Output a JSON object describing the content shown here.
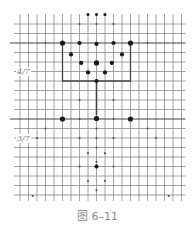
{
  "figure": {
    "caption": "图 6–11",
    "labels": [
      {
        "text": "4/7",
        "x": 16,
        "y": 72
      },
      {
        "text": "3/7",
        "x": 16,
        "y": 139
      }
    ],
    "colors": {
      "grid": "#8c8c8c",
      "grid_bold": "#444444",
      "dot": "#1a1a1a",
      "small_dot": "#555555",
      "caption": "#8a8a8a",
      "background": "#ffffff"
    },
    "grid": {
      "x0": 20,
      "x_step": 8.5,
      "cols": 20,
      "y0": 24,
      "y_step": 9.5,
      "rows": 19,
      "line_top": 14,
      "line_bottom": 201
    },
    "bold_rows": [
      2,
      10
    ],
    "bracket": {
      "left_col": 5,
      "right_col": 13,
      "top_row": 2,
      "bottom_row": 6,
      "stem_col": 9,
      "stem_bottom_row": 9.6
    },
    "dots": [
      {
        "col": 8,
        "row": -1,
        "size": "s"
      },
      {
        "col": 9,
        "row": -1,
        "size": "s"
      },
      {
        "col": 10,
        "row": -1,
        "size": "s"
      },
      {
        "col": 7,
        "row": 0,
        "size": "xs"
      },
      {
        "col": 9,
        "row": 0,
        "size": "xs"
      },
      {
        "col": 11,
        "row": 0,
        "size": "xs"
      },
      {
        "col": 3,
        "row": 2,
        "size": "xs"
      },
      {
        "col": 5,
        "row": 2,
        "size": "l"
      },
      {
        "col": 7,
        "row": 2,
        "size": "m"
      },
      {
        "col": 9,
        "row": 2.1,
        "size": "m"
      },
      {
        "col": 11,
        "row": 2,
        "size": "m"
      },
      {
        "col": 13,
        "row": 2,
        "size": "l"
      },
      {
        "col": 15,
        "row": 2,
        "size": "xs"
      },
      {
        "col": 6,
        "row": 3.2,
        "size": "m"
      },
      {
        "col": 12,
        "row": 3.2,
        "size": "m"
      },
      {
        "col": 7.2,
        "row": 4.1,
        "size": "m"
      },
      {
        "col": 9,
        "row": 4.1,
        "size": "l"
      },
      {
        "col": 10.8,
        "row": 4.1,
        "size": "m"
      },
      {
        "col": 8,
        "row": 5.1,
        "size": "m"
      },
      {
        "col": 10,
        "row": 5.1,
        "size": "m"
      },
      {
        "col": 9,
        "row": 6,
        "size": "m"
      },
      {
        "col": 7,
        "row": 8,
        "size": "xs"
      },
      {
        "col": 11,
        "row": 8,
        "size": "xs"
      },
      {
        "col": 7,
        "row": 10,
        "size": "xs"
      },
      {
        "col": 11,
        "row": 10,
        "size": "xs"
      },
      {
        "col": 5,
        "row": 10,
        "size": "l"
      },
      {
        "col": 9,
        "row": 9.95,
        "size": "l"
      },
      {
        "col": 13,
        "row": 10,
        "size": "l"
      },
      {
        "col": 3,
        "row": 11,
        "size": "xs"
      },
      {
        "col": 9,
        "row": 11,
        "size": "xs"
      },
      {
        "col": 15,
        "row": 11,
        "size": "xs"
      },
      {
        "col": 2,
        "row": 12,
        "size": "xs"
      },
      {
        "col": 7,
        "row": 12,
        "size": "xs"
      },
      {
        "col": 9,
        "row": 12,
        "size": "xs"
      },
      {
        "col": 11,
        "row": 12,
        "size": "xs"
      },
      {
        "col": 16,
        "row": 12,
        "size": "xs"
      },
      {
        "col": 9,
        "row": 13,
        "size": "xs"
      },
      {
        "col": 8,
        "row": 13.6,
        "size": "xs"
      },
      {
        "col": 10,
        "row": 13.6,
        "size": "xs"
      },
      {
        "col": 9,
        "row": 14.5,
        "size": "xs"
      },
      {
        "col": 7,
        "row": 15,
        "size": "xs"
      },
      {
        "col": 9,
        "row": 15,
        "size": "m"
      },
      {
        "col": 11,
        "row": 15,
        "size": "xs"
      },
      {
        "col": 8,
        "row": 16.5,
        "size": "xs"
      },
      {
        "col": 10,
        "row": 16.5,
        "size": "xs"
      },
      {
        "col": 9,
        "row": 17.5,
        "size": "xs"
      },
      {
        "col": 1.5,
        "row": 18.1,
        "size": "xs"
      },
      {
        "col": 17.5,
        "row": 18.1,
        "size": "xs"
      }
    ]
  }
}
